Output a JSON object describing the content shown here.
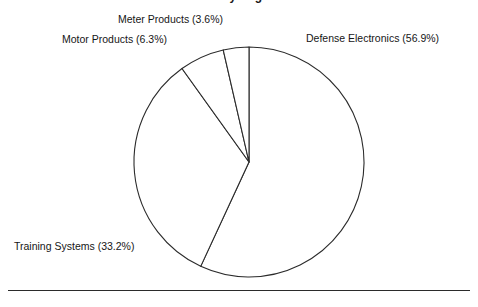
{
  "figure": {
    "title_remnant": "Sales by Segment",
    "background_color": "#ffffff",
    "stroke_color": "#2b2b2b",
    "rule_color": "#2b2b2b"
  },
  "labels": {
    "meter": "Meter Products (3.6%)",
    "motor": "Motor Products (6.3%)",
    "defense": "Defense Electronics (56.9%)",
    "training": "Training Systems (33.2%)"
  },
  "chart_data": {
    "type": "pie",
    "title": "",
    "xlabel": "",
    "ylabel": "",
    "grid": false,
    "legend": "none",
    "labels_position": "outside",
    "start_angle_deg": 0,
    "direction": "clockwise",
    "center": {
      "x": 249,
      "y": 162
    },
    "radius": 115,
    "categories": [
      "Defense Electronics",
      "Training Systems",
      "Motor Products",
      "Meter Products"
    ],
    "values": [
      56.9,
      33.2,
      6.3,
      3.6
    ],
    "units": "percent",
    "slices": [
      {
        "name": "Defense Electronics",
        "value": 56.9,
        "label": "Defense Electronics (56.9%)",
        "start_deg": 0.0,
        "end_deg": 204.84,
        "fill": "#ffffff",
        "stroke": "#2b2b2b"
      },
      {
        "name": "Training Systems",
        "value": 33.2,
        "label": "Training Systems (33.2%)",
        "start_deg": 204.84,
        "end_deg": 324.36,
        "fill": "#ffffff",
        "stroke": "#2b2b2b"
      },
      {
        "name": "Motor Products",
        "value": 6.3,
        "label": "Motor Products (6.3%)",
        "start_deg": 324.36,
        "end_deg": 347.04,
        "fill": "#ffffff",
        "stroke": "#2b2b2b"
      },
      {
        "name": "Meter Products",
        "value": 3.6,
        "label": "Meter Products (3.6%)",
        "start_deg": 347.04,
        "end_deg": 360.0,
        "fill": "#ffffff",
        "stroke": "#2b2b2b"
      }
    ]
  }
}
